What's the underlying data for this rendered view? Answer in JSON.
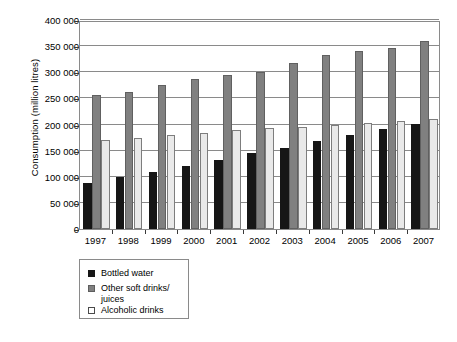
{
  "chart_data": {
    "type": "bar",
    "title": "",
    "xlabel": "",
    "ylabel": "Consumption (million litres)",
    "categories": [
      "1997",
      "1998",
      "1999",
      "2000",
      "2001",
      "2002",
      "2003",
      "2004",
      "2005",
      "2006",
      "2007"
    ],
    "series": [
      {
        "name": "Bottled water",
        "color": "#161616",
        "values": [
          89000,
          99000,
          110000,
          121000,
          133000,
          145000,
          156000,
          168000,
          180000,
          191000,
          201000
        ]
      },
      {
        "name": "Other soft drinks/\njuices",
        "color": "#808080",
        "values": [
          256000,
          262000,
          275000,
          287000,
          294000,
          301000,
          318000,
          333000,
          341000,
          347000,
          359000
        ]
      },
      {
        "name": "Alcoholic drinks",
        "color": "#e9e9e9",
        "values": [
          171000,
          174000,
          179000,
          183000,
          189000,
          193000,
          196000,
          200000,
          202000,
          206000,
          211000
        ]
      }
    ],
    "ylim": [
      0,
      400000
    ],
    "yticks": [
      0,
      50000,
      100000,
      150000,
      200000,
      250000,
      300000,
      350000,
      400000
    ],
    "ytick_labels": [
      "0",
      "50 000",
      "100 000",
      "150 000",
      "200 000",
      "250 000",
      "300 000",
      "350 000",
      "400 000"
    ],
    "grid": true,
    "legend_position": "below-left"
  }
}
